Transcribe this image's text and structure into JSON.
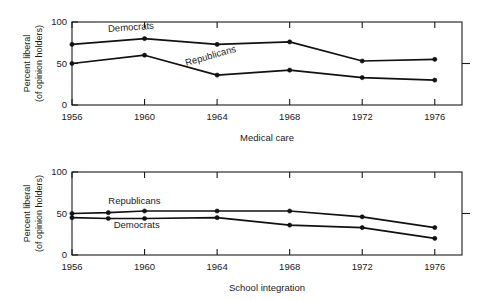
{
  "figure": {
    "background": "#ffffff",
    "ink_color": "#111111"
  },
  "chart_data": [
    {
      "id": "medical-care",
      "type": "line",
      "title": "",
      "xlabel": "Medical care",
      "ylabel": "Percent liberal\n(of opinion holders)",
      "ylabel_line1": "Percent liberal",
      "ylabel_line2": "(of opinion holders)",
      "xlim": [
        1956,
        1977.5
      ],
      "ylim": [
        0,
        100
      ],
      "ytick_values": [
        0,
        50,
        100
      ],
      "ytick_labels": [
        "0",
        "50",
        "100"
      ],
      "xtick_values": [
        1956,
        1960,
        1964,
        1968,
        1972,
        1976
      ],
      "xtick_labels": [
        "1956",
        "1960",
        "1964",
        "1968",
        "1972",
        "1976"
      ],
      "grid": false,
      "legend_position": "inline-annotation",
      "series": [
        {
          "name": "Democrats",
          "label_x": 1958.0,
          "label_y": 88,
          "x": [
            1956,
            1960,
            1964,
            1968,
            1972,
            1976
          ],
          "values": [
            73,
            80,
            73,
            76,
            53,
            55
          ]
        },
        {
          "name": "Republicans",
          "label_x": 1962.3,
          "label_y": 47,
          "x": [
            1956,
            1960,
            1964,
            1968,
            1972,
            1976
          ],
          "values": [
            50,
            60,
            36,
            42,
            33,
            30
          ]
        }
      ]
    },
    {
      "id": "school-integration",
      "type": "line",
      "title": "",
      "xlabel": "School integration",
      "ylabel": "Percent liberal\n(of opinion holders)",
      "ylabel_line1": "Percent liberal",
      "ylabel_line2": "(of opinion holders)",
      "xlim": [
        1956,
        1977.5
      ],
      "ylim": [
        0,
        100
      ],
      "ytick_values": [
        0,
        50,
        100
      ],
      "ytick_labels": [
        "0",
        "50",
        "100"
      ],
      "xtick_values": [
        1956,
        1960,
        1964,
        1968,
        1972,
        1976
      ],
      "xtick_labels": [
        "1956",
        "1960",
        "1964",
        "1968",
        "1972",
        "1976"
      ],
      "grid": false,
      "legend_position": "inline-annotation",
      "series": [
        {
          "name": "Republicans",
          "label_x": 1958.0,
          "label_y": 62,
          "x": [
            1956,
            1958,
            1960,
            1964,
            1968,
            1972,
            1976
          ],
          "values": [
            50,
            51,
            53,
            53,
            53,
            46,
            33
          ]
        },
        {
          "name": "Democrats",
          "label_x": 1958.3,
          "label_y": 33,
          "x": [
            1956,
            1958,
            1960,
            1964,
            1968,
            1972,
            1976
          ],
          "values": [
            45,
            44,
            44,
            45,
            36,
            33,
            20
          ]
        }
      ]
    }
  ]
}
